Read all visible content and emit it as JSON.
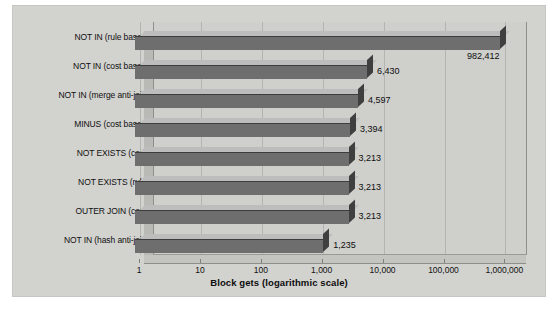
{
  "chart_data": {
    "type": "bar",
    "orientation": "horizontal",
    "title": "",
    "xlabel": "Block gets (logarithmic scale)",
    "ylabel": "",
    "scale": "log",
    "grid": true,
    "legend": "none",
    "xlim": [
      1,
      1000000
    ],
    "xticks": [
      "1",
      "10",
      "100",
      "1,000",
      "10,000",
      "100,000",
      "1,000,000"
    ],
    "xtick_values": [
      1,
      10,
      100,
      1000,
      10000,
      100000,
      1000000
    ],
    "categories": [
      "NOT IN (rule based)",
      "NOT IN (cost based)",
      "NOT IN (merge anti-join)",
      "MINUS (cost based)",
      "NOT EXISTS (cost)",
      "NOT EXISTS (rule)",
      "OUTER JOIN (cost)",
      "NOT IN (hash anti-join)"
    ],
    "values": [
      982412,
      6430,
      4597,
      3394,
      3213,
      3213,
      3213,
      1235
    ],
    "data_labels": [
      "982,412",
      "6,430",
      "4,597",
      "3,394",
      "3,213",
      "3,213",
      "3,213",
      "1,235"
    ],
    "bar_top_color": "#bdbdbd",
    "bar_front_color": "#6e6e6e",
    "bar_cap_color": "#3f3f3f",
    "plot_background": "#d2d2cf",
    "gridline_color": "#b4b4b1"
  }
}
